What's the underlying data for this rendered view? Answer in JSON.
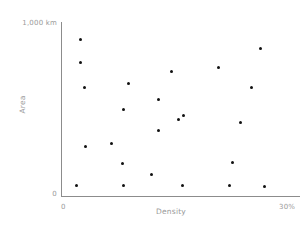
{
  "chart_data": {
    "type": "scatter",
    "title": "",
    "xlabel": "Density",
    "ylabel": "Area",
    "xlim": [
      0,
      30
    ],
    "ylim": [
      0,
      1000
    ],
    "x_tick_labels": [
      "0",
      "30%"
    ],
    "y_tick_labels": [
      "0",
      "1,000 km"
    ],
    "grid": false,
    "legend": "none",
    "marker_color": "#111111",
    "axis_color": "#8c8c8c",
    "label_color": "#9a9a9a",
    "points": [
      {
        "x": 2.4,
        "y": 902
      },
      {
        "x": 2.5,
        "y": 770
      },
      {
        "x": 3.0,
        "y": 621
      },
      {
        "x": 8.5,
        "y": 649
      },
      {
        "x": 7.9,
        "y": 500
      },
      {
        "x": 6.3,
        "y": 299
      },
      {
        "x": 12.3,
        "y": 557
      },
      {
        "x": 13.9,
        "y": 713
      },
      {
        "x": 12.3,
        "y": 374
      },
      {
        "x": 14.8,
        "y": 437
      },
      {
        "x": 15.4,
        "y": 460
      },
      {
        "x": 11.3,
        "y": 121
      },
      {
        "x": 7.7,
        "y": 184
      },
      {
        "x": 3.1,
        "y": 282
      },
      {
        "x": 2.0,
        "y": 63
      },
      {
        "x": 7.8,
        "y": 63
      },
      {
        "x": 15.2,
        "y": 63
      },
      {
        "x": 19.8,
        "y": 741
      },
      {
        "x": 25.0,
        "y": 845
      },
      {
        "x": 23.9,
        "y": 626
      },
      {
        "x": 22.5,
        "y": 425
      },
      {
        "x": 21.5,
        "y": 195
      },
      {
        "x": 21.2,
        "y": 63
      },
      {
        "x": 25.6,
        "y": 57
      }
    ]
  }
}
